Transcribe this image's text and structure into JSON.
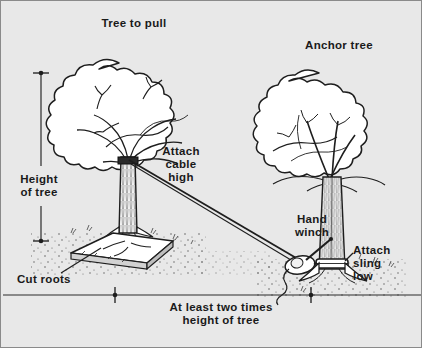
{
  "figure": {
    "background_color": "#e8e8e8",
    "ink_color": "#1a1a1a",
    "border_color": "#8a8a8a"
  },
  "labels": {
    "tree_to_pull": "Tree to pull",
    "anchor_tree": "Anchor tree",
    "attach_cable_high": "Attach\ncable\nhigh",
    "height_of_tree": "Height\nof tree",
    "cut_roots": "Cut roots",
    "hand_winch": "Hand\nwinch",
    "attach_sling_low": "Attach\nsling\nlow",
    "bottom_caption": "At least two times\nheight of tree"
  },
  "dimensions": {
    "vertical": {
      "name": "height-of-tree-dimension",
      "label": "Height of tree",
      "top_tick_y": 72,
      "bottom_tick_y": 240,
      "x": 40
    },
    "horizontal": {
      "name": "spacing-dimension",
      "label": "At least two times height of tree",
      "left_tick_x": 114,
      "right_tick_x": 310,
      "y": 294
    }
  },
  "elements": {
    "pull_tree": {
      "name": "tree-to-pull",
      "attach_point_x": 128,
      "attach_point_y": 158
    },
    "anchor_tree": {
      "name": "anchor-tree",
      "sling_point_x": 330,
      "sling_point_y": 263
    },
    "cable": {
      "name": "cable-line",
      "from_x": 128,
      "from_y": 158,
      "to_x": 303,
      "to_y": 262
    },
    "winch": {
      "name": "hand-winch",
      "x": 300,
      "y": 262
    },
    "root_plate": {
      "name": "cut-root-plate",
      "x": 112,
      "y": 248
    }
  }
}
